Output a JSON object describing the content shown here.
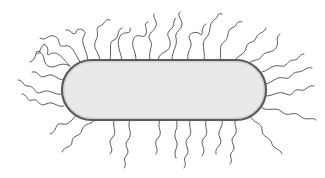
{
  "figure": {
    "subject": "rod-shaped bacterium with peritrichous flagella",
    "parts": [
      "cell-body",
      "flagella"
    ],
    "colors": {
      "background": "#ffffff",
      "cell_fill": "#e9e9e9",
      "cell_outline": "#5a5a5a",
      "flagella": "#4a4a4a"
    }
  }
}
